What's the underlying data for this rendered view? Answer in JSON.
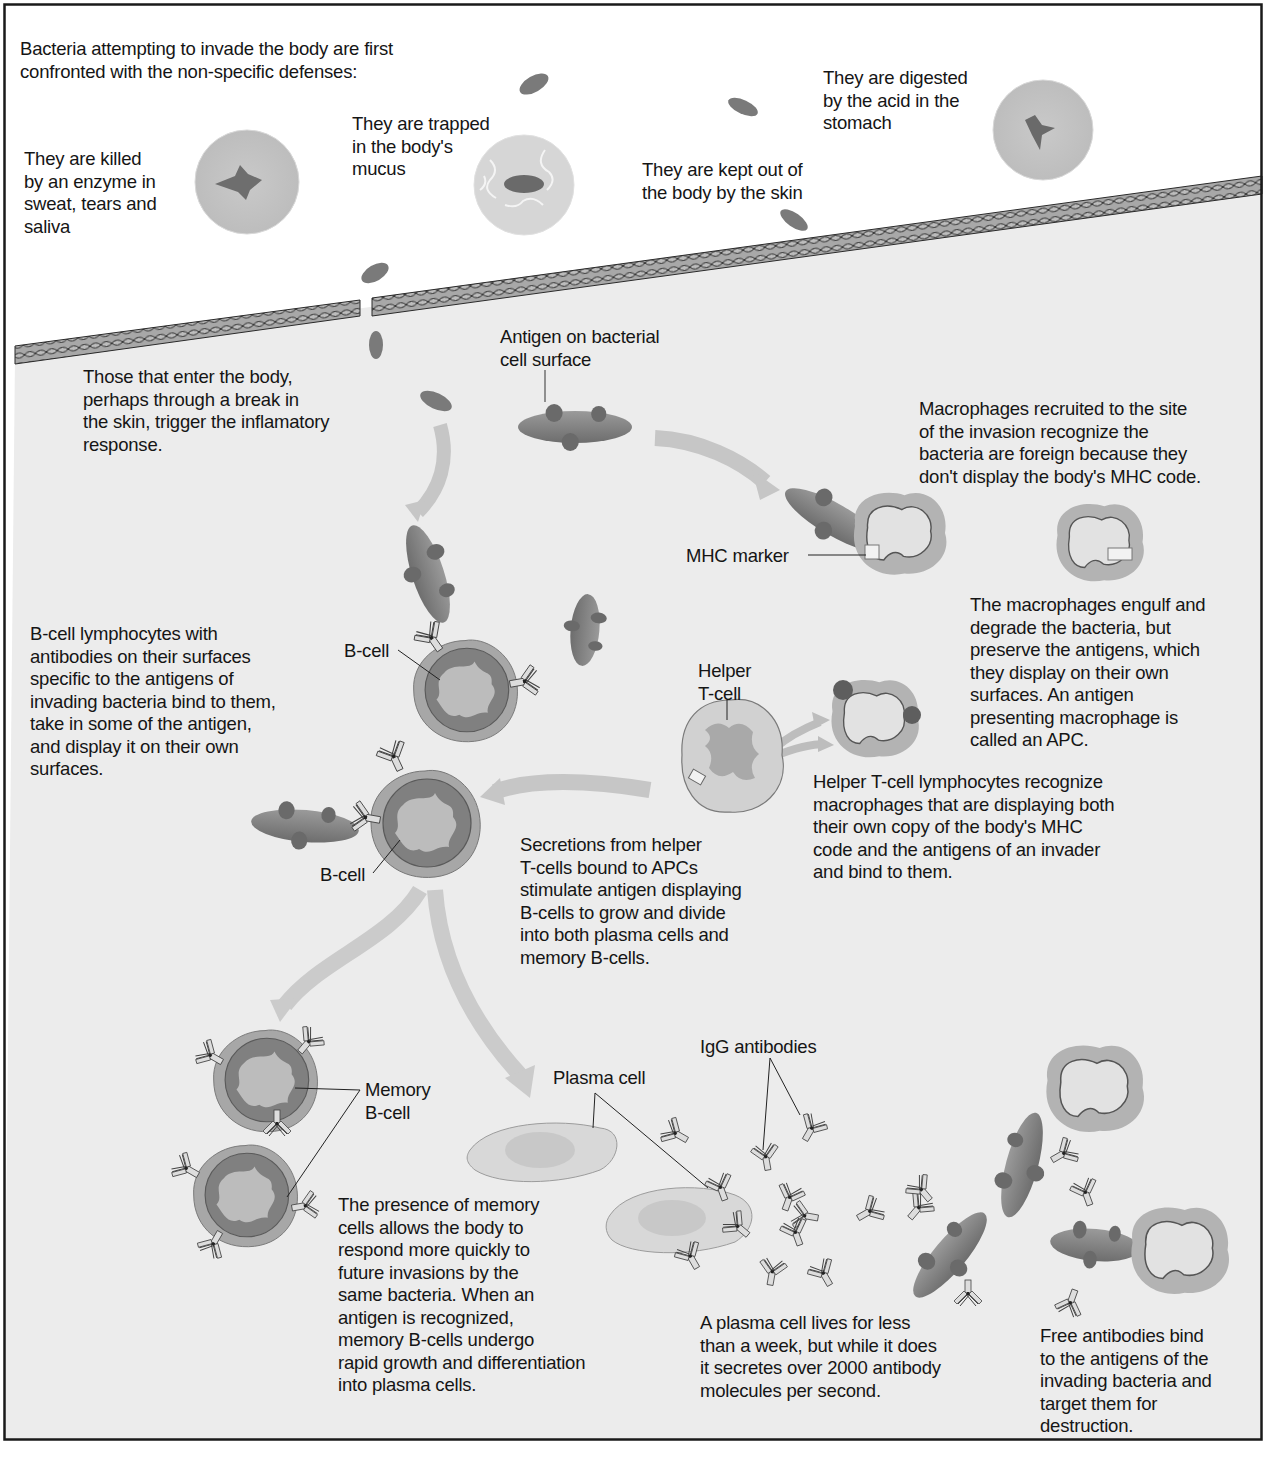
{
  "figure": {
    "colors": {
      "outside_bg": "#ffffff",
      "inside_bg": "#ececec",
      "frame": "#1a1a1a",
      "bacteria": "#7d7d7d",
      "bacteria_dark": "#5f5f5f",
      "arrow": "#c4c4c4",
      "cell_outer": "#9a9a9a",
      "nucleus": "#6e6e6e",
      "macrophage_fringe": "#b4b4b4",
      "macrophage_body": "#dcdcdc",
      "text": "#151515"
    }
  },
  "nonspecific": {
    "intro": "Bacteria attempting to invade the body are first\nconfronted with the non-specific defenses:",
    "enzyme": "They are killed\nby an enzyme in\nsweat, tears and\nsaliva",
    "mucus": "They are trapped\nin the body's\nmucus",
    "skin": "They are kept out of\nthe body by the skin",
    "stomach": "They are digested\nby the acid in the\nstomach"
  },
  "inflammation": {
    "enter": "Those that enter the body,\nperhaps through a break in\nthe skin, trigger the inflamatory\nresponse.",
    "antigen_label": "Antigen on bacterial\ncell surface"
  },
  "macrophage": {
    "recruit": "Macrophages recruited to the site\nof the invasion recognize the\nbacteria are foreign because they\ndon't display the body's MHC code.",
    "mhc_label": "MHC marker",
    "engulf": "The macrophages engulf and\ndegrade the bacteria, but\npreserve the antigens, which\nthey display on their own\nsurfaces. An antigen\npresenting macrophage is\ncalled an APC."
  },
  "bcell": {
    "desc": "B-cell lymphocytes with\nantibodies on their surfaces\nspecific to the antigens of\ninvading bacteria bind to them,\ntake in some of the antigen,\nand display it on their own\nsurfaces.",
    "label_top": "B-cell",
    "label_bottom": "B-cell"
  },
  "helper": {
    "label": "Helper\nT-cell",
    "desc": "Helper T-cell lymphocytes recognize\nmacrophages that are displaying both\ntheir own copy of the body's MHC\ncode and the antigens of an invader\nand bind to them.",
    "secretions": "Secretions from helper\nT-cells bound to APCs\nstimulate antigen displaying\nB-cells to grow and divide\ninto both plasma cells and\nmemory B-cells."
  },
  "memory": {
    "label": "Memory\nB-cell",
    "desc": "The presence of memory\ncells allows the body to\nrespond more quickly to\nfuture invasions by the\nsame bacteria. When an\nantigen is recognized,\nmemory B-cells undergo\nrapid growth and differentiation\ninto plasma cells."
  },
  "plasma": {
    "label": "Plasma cell",
    "igg_label": "IgG antibodies",
    "desc": "A plasma cell lives for less\nthan a week, but while it does\nit secretes over 2000 antibody\nmolecules per second."
  },
  "free_antibodies": {
    "desc": "Free antibodies bind\nto the antigens of the\ninvading bacteria and\ntarget them for\ndestruction."
  }
}
